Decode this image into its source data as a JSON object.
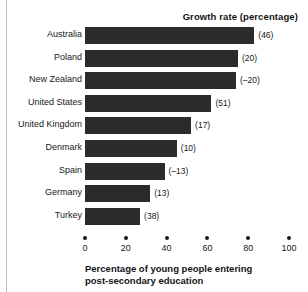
{
  "chart_data": {
    "type": "bar",
    "orientation": "horizontal",
    "title": "",
    "series_title": "Growth rate (percentage)",
    "xlabel": "Percentage of young people entering post-secondary education",
    "xlabel_lines": [
      "Percentage of young people entering",
      "post-secondary education"
    ],
    "ylabel": "",
    "xlim": [
      0,
      100
    ],
    "xticks": [
      0,
      20,
      40,
      60,
      80,
      100
    ],
    "xtick_labels": [
      "0",
      "20",
      "40",
      "60",
      "80",
      "100"
    ],
    "grid": false,
    "legend": false,
    "bar_color": "#2b2b2b",
    "categories": [
      "Australia",
      "Poland",
      "New Zealand",
      "United States",
      "United Kingdom",
      "Denmark",
      "Spain",
      "Germany",
      "Turkey"
    ],
    "values": [
      83,
      75,
      74,
      62,
      52,
      45,
      39,
      32,
      27
    ],
    "annotations": [
      "(46)",
      "(20)",
      "(–20)",
      "(51)",
      "(17)",
      "(10)",
      "(–13)",
      "(13)",
      "(38)"
    ],
    "growth_rates": [
      46,
      20,
      -20,
      51,
      17,
      10,
      -13,
      13,
      38
    ]
  }
}
